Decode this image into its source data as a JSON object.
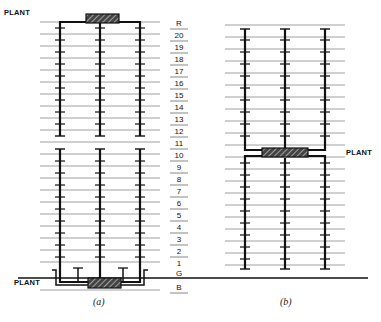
{
  "diagram": {
    "type": "building-riser-schematic",
    "labels": {
      "plant_a_top": "PLANT",
      "plant_a_bottom": "PLANT",
      "plant_b_middle": "PLANT",
      "caption_a": "(a)",
      "caption_b": "(b)"
    },
    "floors": [
      "R",
      "20",
      "19",
      "18",
      "17",
      "16",
      "15",
      "14",
      "13",
      "12",
      "11",
      "10",
      "9",
      "8",
      "7",
      "6",
      "5",
      "4",
      "3",
      "2",
      "1",
      "G",
      "B"
    ],
    "colors": {
      "line": "#111111",
      "floor_line": "#777777",
      "background": "#ffffff"
    }
  }
}
